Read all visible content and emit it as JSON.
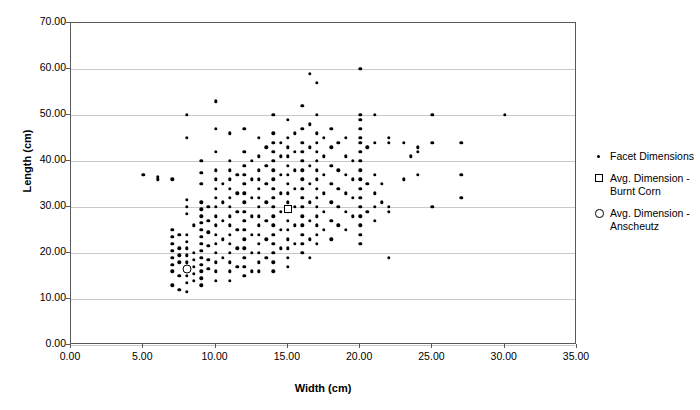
{
  "chart_data": {
    "type": "scatter",
    "title": "",
    "xlabel": "Width (cm)",
    "ylabel": "Length (cm)",
    "xlim": [
      0,
      35
    ],
    "ylim": [
      0,
      70
    ],
    "xticks": [
      "0.00",
      "5.00",
      "10.00",
      "15.00",
      "20.00",
      "25.00",
      "30.00",
      "35.00"
    ],
    "yticks": [
      "0.00",
      "10.00",
      "20.00",
      "30.00",
      "40.00",
      "50.00",
      "60.00",
      "70.00"
    ],
    "xtick_values": [
      0,
      5,
      10,
      15,
      20,
      25,
      30,
      35
    ],
    "ytick_values": [
      0,
      10,
      20,
      30,
      40,
      50,
      60,
      70
    ],
    "grid": "horizontal",
    "legend_position": "right",
    "series": [
      {
        "name": "Facet Dimensions",
        "marker": "dot",
        "points": [
          [
            5,
            37
          ],
          [
            6,
            36
          ],
          [
            6,
            36.5
          ],
          [
            7,
            36
          ],
          [
            7,
            25
          ],
          [
            7,
            23.5
          ],
          [
            7,
            22
          ],
          [
            7,
            20.5
          ],
          [
            7,
            19
          ],
          [
            7,
            17.5
          ],
          [
            7,
            16
          ],
          [
            7,
            13
          ],
          [
            7.5,
            24
          ],
          [
            7.5,
            21
          ],
          [
            7.5,
            19.5
          ],
          [
            7.5,
            18
          ],
          [
            7.5,
            15
          ],
          [
            7.5,
            12
          ],
          [
            8,
            50
          ],
          [
            8,
            45
          ],
          [
            8,
            31.5
          ],
          [
            8,
            30
          ],
          [
            8,
            28.5
          ],
          [
            8,
            24
          ],
          [
            8,
            22.5
          ],
          [
            8,
            21
          ],
          [
            8,
            19.5
          ],
          [
            8,
            18
          ],
          [
            8,
            16.5
          ],
          [
            8,
            15
          ],
          [
            8,
            13.5
          ],
          [
            8,
            11.5
          ],
          [
            8.5,
            26
          ],
          [
            8.5,
            20
          ],
          [
            8.5,
            18.5
          ],
          [
            8.5,
            17
          ],
          [
            8.5,
            15.5
          ],
          [
            8.5,
            14
          ],
          [
            9,
            40
          ],
          [
            9,
            37.5
          ],
          [
            9,
            35
          ],
          [
            9,
            31
          ],
          [
            9,
            29.5
          ],
          [
            9,
            28
          ],
          [
            9,
            26.5
          ],
          [
            9,
            25
          ],
          [
            9,
            23.5
          ],
          [
            9,
            22
          ],
          [
            9,
            20.5
          ],
          [
            9,
            19
          ],
          [
            9,
            17.5
          ],
          [
            9,
            16
          ],
          [
            9,
            14.5
          ],
          [
            9,
            13
          ],
          [
            9.5,
            30
          ],
          [
            9.5,
            27
          ],
          [
            9.5,
            24.5
          ],
          [
            9.5,
            21.5
          ],
          [
            9.5,
            18.5
          ],
          [
            9.5,
            16.5
          ],
          [
            10,
            53
          ],
          [
            10,
            47
          ],
          [
            10,
            42
          ],
          [
            10,
            38
          ],
          [
            10,
            36
          ],
          [
            10,
            34
          ],
          [
            10,
            32
          ],
          [
            10,
            30
          ],
          [
            10,
            28
          ],
          [
            10,
            26
          ],
          [
            10,
            24
          ],
          [
            10,
            22
          ],
          [
            10,
            20
          ],
          [
            10,
            18
          ],
          [
            10,
            16
          ],
          [
            10,
            14
          ],
          [
            10.5,
            35
          ],
          [
            10.5,
            31
          ],
          [
            10.5,
            27
          ],
          [
            10.5,
            23
          ],
          [
            10.5,
            19
          ],
          [
            11,
            46
          ],
          [
            11,
            40
          ],
          [
            11,
            38
          ],
          [
            11,
            36
          ],
          [
            11,
            34
          ],
          [
            11,
            32
          ],
          [
            11,
            30
          ],
          [
            11,
            28
          ],
          [
            11,
            26
          ],
          [
            11,
            24
          ],
          [
            11,
            22
          ],
          [
            11,
            20
          ],
          [
            11,
            18
          ],
          [
            11,
            16
          ],
          [
            11,
            14
          ],
          [
            11.5,
            37
          ],
          [
            11.5,
            33
          ],
          [
            11.5,
            29
          ],
          [
            11.5,
            25
          ],
          [
            11.5,
            21
          ],
          [
            11.5,
            17
          ],
          [
            12,
            47
          ],
          [
            12,
            42
          ],
          [
            12,
            39
          ],
          [
            12,
            37
          ],
          [
            12,
            35
          ],
          [
            12,
            33
          ],
          [
            12,
            31
          ],
          [
            12,
            29
          ],
          [
            12,
            27
          ],
          [
            12,
            25
          ],
          [
            12,
            23
          ],
          [
            12,
            21
          ],
          [
            12,
            19
          ],
          [
            12,
            17
          ],
          [
            12,
            15
          ],
          [
            12.5,
            40
          ],
          [
            12.5,
            36
          ],
          [
            12.5,
            32
          ],
          [
            12.5,
            28
          ],
          [
            12.5,
            24
          ],
          [
            12.5,
            20
          ],
          [
            12.5,
            16
          ],
          [
            13,
            45
          ],
          [
            13,
            41
          ],
          [
            13,
            38
          ],
          [
            13,
            36
          ],
          [
            13,
            34
          ],
          [
            13,
            32
          ],
          [
            13,
            30
          ],
          [
            13,
            28
          ],
          [
            13,
            26
          ],
          [
            13,
            24
          ],
          [
            13,
            22
          ],
          [
            13,
            20
          ],
          [
            13,
            18
          ],
          [
            13,
            16
          ],
          [
            13.5,
            43
          ],
          [
            13.5,
            39
          ],
          [
            13.5,
            35
          ],
          [
            13.5,
            31
          ],
          [
            13.5,
            27
          ],
          [
            13.5,
            23
          ],
          [
            13.5,
            19
          ],
          [
            14,
            50
          ],
          [
            14,
            46
          ],
          [
            14,
            44
          ],
          [
            14,
            42
          ],
          [
            14,
            40
          ],
          [
            14,
            38
          ],
          [
            14,
            36
          ],
          [
            14,
            34
          ],
          [
            14,
            32
          ],
          [
            14,
            30
          ],
          [
            14,
            28
          ],
          [
            14,
            26
          ],
          [
            14,
            24
          ],
          [
            14,
            22
          ],
          [
            14,
            20
          ],
          [
            14,
            18
          ],
          [
            14,
            16
          ],
          [
            14.5,
            44
          ],
          [
            14.5,
            41
          ],
          [
            14.5,
            37
          ],
          [
            14.5,
            33
          ],
          [
            14.5,
            29
          ],
          [
            14.5,
            25
          ],
          [
            14.5,
            21
          ],
          [
            15,
            49
          ],
          [
            15,
            45
          ],
          [
            15,
            43
          ],
          [
            15,
            41
          ],
          [
            15,
            39
          ],
          [
            15,
            37
          ],
          [
            15,
            35
          ],
          [
            15,
            33
          ],
          [
            15,
            31
          ],
          [
            15,
            29
          ],
          [
            15,
            27
          ],
          [
            15,
            25
          ],
          [
            15,
            23
          ],
          [
            15,
            21
          ],
          [
            15,
            19
          ],
          [
            15,
            17
          ],
          [
            15.5,
            46
          ],
          [
            15.5,
            42
          ],
          [
            15.5,
            38
          ],
          [
            15.5,
            34
          ],
          [
            15.5,
            30
          ],
          [
            15.5,
            26
          ],
          [
            15.5,
            22
          ],
          [
            16,
            52
          ],
          [
            16,
            47
          ],
          [
            16,
            44
          ],
          [
            16,
            42
          ],
          [
            16,
            40
          ],
          [
            16,
            38
          ],
          [
            16,
            36
          ],
          [
            16,
            34
          ],
          [
            16,
            32
          ],
          [
            16,
            30
          ],
          [
            16,
            28
          ],
          [
            16,
            26
          ],
          [
            16,
            24
          ],
          [
            16,
            22
          ],
          [
            16,
            20
          ],
          [
            16.5,
            59
          ],
          [
            16.5,
            48
          ],
          [
            16.5,
            43
          ],
          [
            16.5,
            39
          ],
          [
            16.5,
            35
          ],
          [
            16.5,
            31
          ],
          [
            16.5,
            27
          ],
          [
            16.5,
            23
          ],
          [
            16.5,
            19
          ],
          [
            17,
            57
          ],
          [
            17,
            50
          ],
          [
            17,
            46
          ],
          [
            17,
            44
          ],
          [
            17,
            42
          ],
          [
            17,
            40
          ],
          [
            17,
            38
          ],
          [
            17,
            36
          ],
          [
            17,
            34
          ],
          [
            17,
            32
          ],
          [
            17,
            30
          ],
          [
            17,
            28
          ],
          [
            17,
            26
          ],
          [
            17,
            24
          ],
          [
            17,
            22
          ],
          [
            17.5,
            45
          ],
          [
            17.5,
            41
          ],
          [
            17.5,
            37
          ],
          [
            17.5,
            33
          ],
          [
            17.5,
            29
          ],
          [
            17.5,
            25
          ],
          [
            18,
            47
          ],
          [
            18,
            43
          ],
          [
            18,
            39
          ],
          [
            18,
            35
          ],
          [
            18,
            31
          ],
          [
            18,
            27
          ],
          [
            18,
            23
          ],
          [
            18.5,
            44
          ],
          [
            18.5,
            38
          ],
          [
            18.5,
            34
          ],
          [
            18.5,
            30
          ],
          [
            18.5,
            26
          ],
          [
            19,
            45
          ],
          [
            19,
            41
          ],
          [
            19,
            37
          ],
          [
            19,
            33
          ],
          [
            19,
            29
          ],
          [
            19,
            25
          ],
          [
            19.5,
            40
          ],
          [
            19.5,
            36
          ],
          [
            19.5,
            32
          ],
          [
            19.5,
            28
          ],
          [
            20,
            60
          ],
          [
            20,
            50
          ],
          [
            20,
            49
          ],
          [
            20,
            47
          ],
          [
            20,
            45
          ],
          [
            20,
            44
          ],
          [
            20,
            42
          ],
          [
            20,
            40
          ],
          [
            20,
            38
          ],
          [
            20,
            36
          ],
          [
            20,
            34
          ],
          [
            20,
            32
          ],
          [
            20,
            30
          ],
          [
            20,
            28
          ],
          [
            20,
            26
          ],
          [
            20,
            24
          ],
          [
            20,
            22
          ],
          [
            20.5,
            43
          ],
          [
            20.5,
            35
          ],
          [
            20.5,
            29
          ],
          [
            21,
            50
          ],
          [
            21,
            44
          ],
          [
            21,
            37
          ],
          [
            21,
            33
          ],
          [
            21,
            30
          ],
          [
            21,
            27
          ],
          [
            21.5,
            35
          ],
          [
            21.5,
            31
          ],
          [
            22,
            45
          ],
          [
            22,
            44
          ],
          [
            22,
            30
          ],
          [
            22,
            29
          ],
          [
            22,
            19
          ],
          [
            23,
            44
          ],
          [
            23,
            36
          ],
          [
            23.5,
            41
          ],
          [
            24,
            43
          ],
          [
            24,
            42
          ],
          [
            24,
            37
          ],
          [
            25,
            50
          ],
          [
            25,
            44
          ],
          [
            25,
            30
          ],
          [
            27,
            44
          ],
          [
            27,
            37
          ],
          [
            27,
            32
          ],
          [
            30,
            50
          ]
        ]
      },
      {
        "name": "Avg. Dimension - Burnt Corn",
        "marker": "square",
        "points": [
          [
            15,
            29.5
          ]
        ]
      },
      {
        "name": "Avg. Dimension - Anscheutz",
        "marker": "circle",
        "points": [
          [
            8,
            16.5
          ]
        ]
      }
    ],
    "legend": [
      {
        "label": "Facet Dimensions",
        "marker": "dot"
      },
      {
        "label": "Avg. Dimension -\nBurnt Corn",
        "marker": "square"
      },
      {
        "label": "Avg. Dimension -\nAnscheutz",
        "marker": "circle"
      }
    ]
  }
}
